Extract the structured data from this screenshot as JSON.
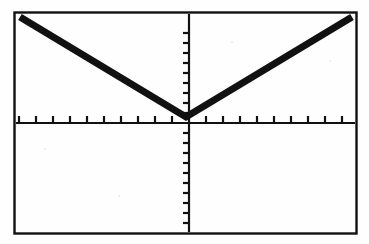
{
  "document": {
    "kind": "graphing-calculator-screen",
    "description": "Scanned black-and-white graphing calculator display showing a V-shaped absolute value graph"
  },
  "screen": {
    "background_color": "#fefefe",
    "ink_color": "#111111",
    "border": {
      "present": true,
      "style": "solid rectangle frame",
      "color": "#111111",
      "stroke_width": 2.4,
      "left": 14,
      "top": 12,
      "right": 357,
      "bottom": 234
    }
  },
  "chart_data": {
    "type": "line",
    "title": "",
    "subtitle": "",
    "xlabel": "",
    "ylabel": "",
    "grid": false,
    "legend": null,
    "legend_position": "none",
    "function_label": "y = |x|",
    "axes": {
      "x_axis": {
        "visible": true,
        "pixel_y": 123,
        "tick_count_left": 10,
        "tick_count_right": 10,
        "tick_spacing_px": 17,
        "tick_length_px": 7,
        "tick_direction": "up",
        "range": [
          -10,
          10
        ],
        "tick_labels": []
      },
      "y_axis": {
        "visible": true,
        "pixel_x": 189,
        "tick_count_above": 9,
        "tick_count_below": 11,
        "tick_spacing_px": 10,
        "tick_length_px": 6,
        "tick_direction": "left",
        "range": [
          -10,
          10
        ],
        "tick_labels": []
      }
    },
    "xlim": [
      -10.2,
      9.9
    ],
    "ylim": [
      -11.1,
      10.7
    ],
    "series": [
      {
        "name": "absolute-value-curve",
        "color": "#111111",
        "stroke_width": 7,
        "points_px": [
          [
            20,
            17
          ],
          [
            186,
            117
          ],
          [
            352,
            17
          ]
        ],
        "vertex_px": [
          186,
          117
        ],
        "vertex_value": [
          -0.2,
          0.6
        ],
        "left_endpoint_value": [
          -10.0,
          10.6
        ],
        "right_endpoint_value": [
          9.8,
          10.6
        ],
        "slope_left": -1.0,
        "slope_right": 1.0
      }
    ]
  }
}
